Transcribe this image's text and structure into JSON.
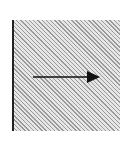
{
  "diagram": {
    "elements": [
      {
        "type": "hatched-region",
        "description": "diagonally hatched square region"
      },
      {
        "type": "boundary-line",
        "position": "left edge",
        "color": "#222222"
      },
      {
        "type": "arrow",
        "direction": "right",
        "color": "#111111"
      }
    ],
    "colors": {
      "hatch_dark": "#9a9a9a",
      "hatch_light": "#e6e6e6",
      "line": "#222222",
      "arrow": "#111111"
    }
  }
}
